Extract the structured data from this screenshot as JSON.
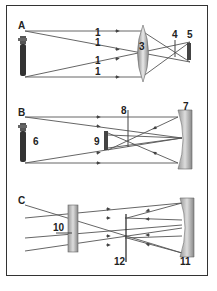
{
  "panels": [
    {
      "label": "A",
      "description": "Convex lens forming a real inverted image"
    },
    {
      "label": "B",
      "description": "Concave mirror forming a real inverted image"
    },
    {
      "label": "C",
      "description": "Reflecting telescope arrangement"
    }
  ],
  "numbers": {
    "n1": "1",
    "n3": "3",
    "n4": "4",
    "n5": "5",
    "n6": "6",
    "n7": "7",
    "n8": "8",
    "n9": "9",
    "n10": "10",
    "n11": "11",
    "n12": "12"
  },
  "colors": {
    "ray": "#555555",
    "frame": "#333333",
    "optic_fill": "#b0b0b0",
    "object_fill": "#444444"
  }
}
